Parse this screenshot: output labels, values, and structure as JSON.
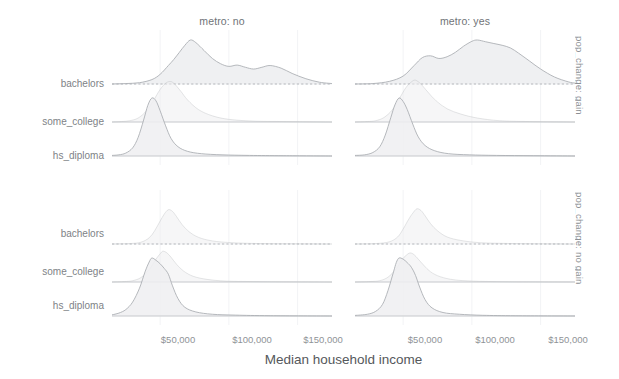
{
  "figure": {
    "type": "ridgeline-facet-grid",
    "background": "#ffffff",
    "fill_color": "#eeeff1",
    "line_color": "#a9adb1",
    "grid_color": "#f2f3f5",
    "text_color": "#7e8286"
  },
  "axis": {
    "x_title": "Median household income",
    "x_ticks": [
      "$50,000",
      "$100,000",
      "$150,000"
    ],
    "x_tick_values": [
      50000,
      100000,
      150000
    ],
    "x_range": [
      15000,
      175000
    ],
    "y_categories": [
      "bachelors",
      "some_college",
      "hs_diploma"
    ]
  },
  "columns": [
    {
      "label": "metro: no"
    },
    {
      "label": "metro: yes"
    }
  ],
  "rows": [
    {
      "label": "pop_change: gain"
    },
    {
      "label": "pop_change: no gain"
    }
  ],
  "chart_data": {
    "type": "area",
    "title": "",
    "xlabel": "Median household income",
    "ylabel": "",
    "xlim": [
      15000,
      175000
    ],
    "grid": true,
    "legend": "none",
    "facet_rows": [
      "pop_change: gain",
      "pop_change: no gain"
    ],
    "facet_cols": [
      "metro: no",
      "metro: yes"
    ],
    "ridge_categories": [
      "hs_diploma",
      "some_college",
      "bachelors"
    ],
    "panels": [
      {
        "row": "pop_change: gain",
        "col": "metro: no",
        "series": [
          {
            "name": "hs_diploma",
            "baseline": "hs_diploma",
            "peak_x": 44000,
            "peak_height": 1.0,
            "shape": "unimodal",
            "x": [
              15000,
              20000,
              25000,
              30000,
              34000,
              38000,
              41000,
              44000,
              47000,
              50000,
              54000,
              58000,
              63000,
              70000,
              80000,
              95000,
              115000,
              140000,
              175000
            ],
            "y": [
              0.01,
              0.02,
              0.05,
              0.14,
              0.32,
              0.62,
              0.87,
              1.0,
              0.95,
              0.78,
              0.52,
              0.3,
              0.16,
              0.08,
              0.04,
              0.02,
              0.01,
              0.005,
              0.0
            ]
          },
          {
            "name": "some_college",
            "baseline": "some_college",
            "peak_x": 56000,
            "peak_height": 0.92,
            "shape": "unimodal-right-skew",
            "x": [
              15000,
              22000,
              28000,
              34000,
              40000,
              45000,
              50000,
              54000,
              57000,
              60000,
              65000,
              70000,
              78000,
              88000,
              100000,
              118000,
              140000,
              175000
            ],
            "y": [
              0.0,
              0.01,
              0.03,
              0.09,
              0.25,
              0.48,
              0.74,
              0.88,
              0.92,
              0.88,
              0.7,
              0.5,
              0.28,
              0.14,
              0.06,
              0.02,
              0.01,
              0.0
            ]
          },
          {
            "name": "bachelors",
            "baseline": "bachelors",
            "peak_x": 72000,
            "peak_height": 1.0,
            "shape": "multimodal",
            "x": [
              15000,
              25000,
              35000,
              44000,
              50000,
              56000,
              60000,
              64000,
              68000,
              72000,
              76000,
              82000,
              88000,
              94000,
              100000,
              106000,
              112000,
              118000,
              124000,
              130000,
              138000,
              146000,
              156000,
              166000,
              175000
            ],
            "y": [
              0.0,
              0.01,
              0.03,
              0.1,
              0.22,
              0.42,
              0.56,
              0.72,
              0.88,
              1.0,
              0.94,
              0.76,
              0.58,
              0.46,
              0.4,
              0.43,
              0.38,
              0.34,
              0.38,
              0.42,
              0.36,
              0.24,
              0.12,
              0.04,
              0.01
            ]
          }
        ]
      },
      {
        "row": "pop_change: gain",
        "col": "metro: yes",
        "series": [
          {
            "name": "hs_diploma",
            "baseline": "hs_diploma",
            "peak_x": 47000,
            "peak_height": 1.0,
            "shape": "unimodal",
            "x": [
              15000,
              22000,
              28000,
              33000,
              37000,
              41000,
              44000,
              47000,
              50000,
              53000,
              57000,
              61000,
              66000,
              73000,
              83000,
              98000,
              118000,
              145000,
              175000
            ],
            "y": [
              0.01,
              0.02,
              0.06,
              0.16,
              0.36,
              0.66,
              0.88,
              1.0,
              0.94,
              0.8,
              0.55,
              0.33,
              0.18,
              0.09,
              0.04,
              0.02,
              0.01,
              0.005,
              0.0
            ]
          },
          {
            "name": "some_college",
            "baseline": "some_college",
            "peak_x": 58000,
            "peak_height": 0.95,
            "shape": "unimodal-right-skew",
            "x": [
              15000,
              24000,
              30000,
              36000,
              42000,
              47000,
              52000,
              56000,
              59000,
              63000,
              68000,
              74000,
              82000,
              92000,
              104000,
              120000,
              142000,
              175000
            ],
            "y": [
              0.0,
              0.01,
              0.03,
              0.1,
              0.27,
              0.52,
              0.78,
              0.91,
              0.95,
              0.86,
              0.68,
              0.48,
              0.3,
              0.18,
              0.09,
              0.03,
              0.01,
              0.0
            ]
          },
          {
            "name": "bachelors",
            "baseline": "bachelors",
            "peak_x": 104000,
            "peak_height": 1.0,
            "shape": "bimodal",
            "x": [
              15000,
              28000,
              40000,
              50000,
              58000,
              64000,
              70000,
              76000,
              82000,
              88000,
              94000,
              100000,
              104000,
              110000,
              116000,
              122000,
              128000,
              134000,
              142000,
              150000,
              160000,
              170000,
              175000
            ],
            "y": [
              0.0,
              0.01,
              0.06,
              0.18,
              0.42,
              0.6,
              0.64,
              0.58,
              0.62,
              0.72,
              0.86,
              0.97,
              1.0,
              0.96,
              0.92,
              0.88,
              0.82,
              0.7,
              0.52,
              0.34,
              0.16,
              0.05,
              0.02
            ]
          }
        ]
      },
      {
        "row": "pop_change: no gain",
        "col": "metro: no",
        "series": [
          {
            "name": "hs_diploma",
            "baseline": "hs_diploma",
            "peak_x": 44000,
            "peak_height": 1.0,
            "shape": "unimodal-broad",
            "x": [
              15000,
              20000,
              25000,
              30000,
              35000,
              39000,
              42000,
              44000,
              47000,
              50000,
              53000,
              56000,
              59000,
              63000,
              68000,
              76000,
              88000,
              105000,
              130000,
              175000
            ],
            "y": [
              0.02,
              0.05,
              0.11,
              0.24,
              0.48,
              0.76,
              0.93,
              1.0,
              0.96,
              0.9,
              0.82,
              0.72,
              0.52,
              0.3,
              0.15,
              0.07,
              0.03,
              0.015,
              0.005,
              0.0
            ]
          },
          {
            "name": "some_college",
            "baseline": "some_college",
            "peak_x": 52000,
            "peak_height": 0.7,
            "shape": "unimodal-faint",
            "x": [
              15000,
              24000,
              30000,
              36000,
              42000,
              47000,
              50000,
              52000,
              55000,
              58000,
              62000,
              67000,
              74000,
              84000,
              98000,
              118000,
              145000,
              175000
            ],
            "y": [
              0.0,
              0.01,
              0.03,
              0.1,
              0.28,
              0.52,
              0.64,
              0.7,
              0.66,
              0.56,
              0.4,
              0.25,
              0.13,
              0.06,
              0.02,
              0.01,
              0.004,
              0.0
            ]
          },
          {
            "name": "bachelors",
            "baseline": "bachelors",
            "peak_x": 56000,
            "peak_height": 0.78,
            "shape": "unimodal-narrow-faint",
            "x": [
              15000,
              28000,
              36000,
              42000,
              46000,
              50000,
              53000,
              56000,
              59000,
              62000,
              66000,
              71000,
              78000,
              88000,
              102000,
              122000,
              148000,
              175000
            ],
            "y": [
              0.0,
              0.01,
              0.04,
              0.14,
              0.3,
              0.52,
              0.68,
              0.78,
              0.74,
              0.62,
              0.44,
              0.28,
              0.15,
              0.07,
              0.03,
              0.01,
              0.004,
              0.0
            ]
          }
        ]
      },
      {
        "row": "pop_change: no gain",
        "col": "metro: yes",
        "series": [
          {
            "name": "hs_diploma",
            "baseline": "hs_diploma",
            "peak_x": 47000,
            "peak_height": 1.0,
            "shape": "unimodal",
            "x": [
              15000,
              24000,
              30000,
              35000,
              39000,
              43000,
              45000,
              47000,
              50000,
              53000,
              56000,
              59000,
              62000,
              66000,
              71000,
              79000,
              91000,
              108000,
              132000,
              175000
            ],
            "y": [
              0.01,
              0.03,
              0.08,
              0.2,
              0.44,
              0.76,
              0.92,
              1.0,
              0.98,
              0.92,
              0.84,
              0.7,
              0.5,
              0.28,
              0.14,
              0.06,
              0.03,
              0.012,
              0.004,
              0.0
            ]
          },
          {
            "name": "some_college",
            "baseline": "some_college",
            "peak_x": 55000,
            "peak_height": 0.66,
            "shape": "unimodal-faint",
            "x": [
              15000,
              26000,
              33000,
              39000,
              45000,
              49000,
              52000,
              55000,
              58000,
              61000,
              65000,
              70000,
              77000,
              87000,
              101000,
              121000,
              148000,
              175000
            ],
            "y": [
              0.0,
              0.01,
              0.03,
              0.11,
              0.3,
              0.5,
              0.6,
              0.66,
              0.62,
              0.52,
              0.38,
              0.23,
              0.12,
              0.05,
              0.02,
              0.008,
              0.003,
              0.0
            ]
          },
          {
            "name": "bachelors",
            "baseline": "bachelors",
            "peak_x": 60000,
            "peak_height": 0.8,
            "shape": "unimodal-narrow-faint",
            "x": [
              15000,
              30000,
              40000,
              46000,
              50000,
              54000,
              57000,
              60000,
              63000,
              66000,
              70000,
              75000,
              82000,
              92000,
              106000,
              126000,
              150000,
              175000
            ],
            "y": [
              0.0,
              0.01,
              0.05,
              0.16,
              0.34,
              0.56,
              0.7,
              0.8,
              0.76,
              0.64,
              0.46,
              0.3,
              0.16,
              0.08,
              0.03,
              0.012,
              0.004,
              0.0
            ]
          }
        ]
      }
    ]
  }
}
